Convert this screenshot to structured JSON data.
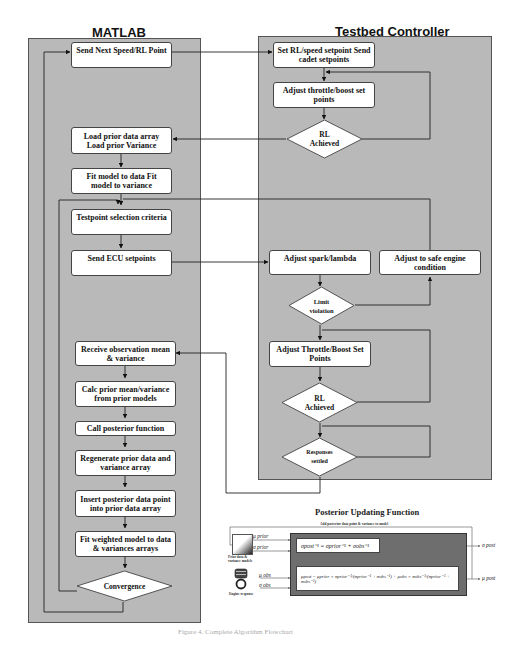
{
  "matlab": {
    "title": "MATLAB",
    "boxes": {
      "send_next": "Send Next Speed/RL Point",
      "load_prior": "Load prior data array Load prior Variance",
      "fit_model": "Fit model to data Fit model to variance",
      "testpoint": "Testpoint selection criteria",
      "send_ecu": "Send ECU setpoints",
      "receive_obs": "Receive observation mean & variance",
      "calc_prior": "Calc prior mean/variance from prior models",
      "call_posterior": "Call posterior function",
      "regenerate": "Regenerate prior data and variance array",
      "insert_posterior": "Insert posterior data point into prior data array",
      "fit_weighted": "Fit weighted model to data & variances arrays"
    },
    "decisions": {
      "convergence": "Convergence"
    }
  },
  "testbed": {
    "title": "Testbed Controller",
    "boxes": {
      "set_rl": "Set RL/speed setpoint Send cadet setpoints",
      "adjust_throttle_1": "Adjust throttle/boost set points",
      "adjust_spark": "Adjust spark/lambda",
      "adjust_safe": "Adjust to safe engine condition",
      "adjust_throttle_2": "Adjust Throttle/Boost Set Points"
    },
    "decisions": {
      "rl_achieved_1": "RL Achieved",
      "limit_violation": "Limit violation",
      "rl_achieved_2": "RL Achieved",
      "responses_settled": "Responses settled"
    }
  },
  "posterior": {
    "title": "Posterior Updating Function",
    "subtitle": "Add posterior data point & variance to model",
    "inputs": {
      "mu_prior": "μ prior",
      "sigma_prior": "σ prior",
      "mu_obs": "μ obs",
      "sigma_obs": "σ obs"
    },
    "prior_label": "Prior data & variance models",
    "engine_label": "Engine response",
    "eq_sigma": "σpost⁻¹ = σprior⁻¹ + σobs⁻¹",
    "eq_mu": "μpost = μprior × σprior⁻¹/(σprior⁻¹ + σobs⁻¹) + μobs × σobs⁻¹/(σprior⁻¹ + σobs⁻¹)",
    "outputs": {
      "sigma_post": "σ post",
      "mu_post": "μ post"
    }
  },
  "caption": "Figure 4. Complete Algorithm Flowchart"
}
